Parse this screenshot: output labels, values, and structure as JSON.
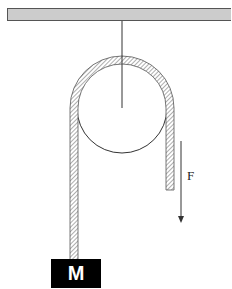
{
  "diagram": {
    "type": "pulley",
    "mass_label": "M",
    "force_label": "F",
    "colors": {
      "ceiling_fill": "#cccccc",
      "ceiling_border": "#555555",
      "rope_hatch": "#666666",
      "mass_fill": "#000000",
      "mass_text": "#ffffff",
      "line": "#333333"
    }
  }
}
